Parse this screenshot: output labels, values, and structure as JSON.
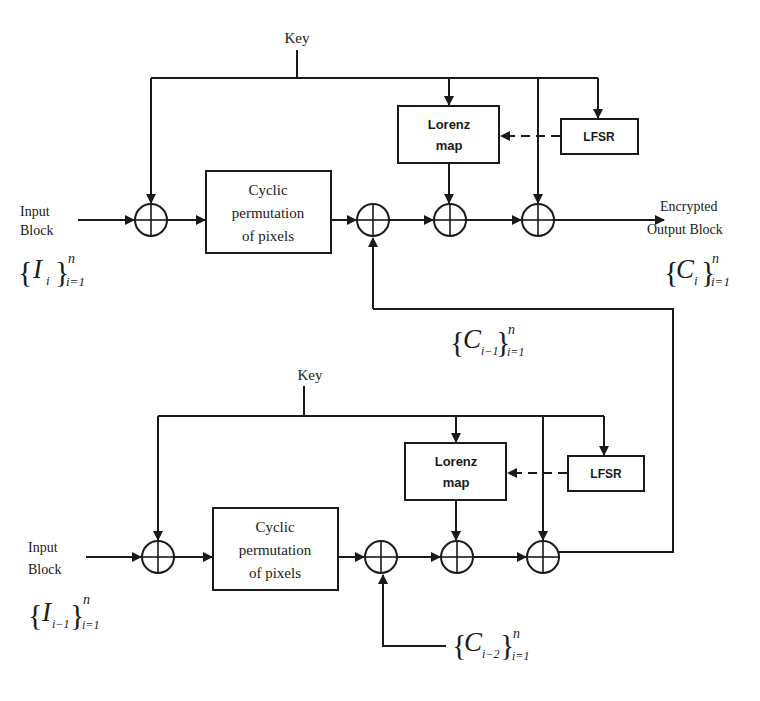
{
  "diagram": {
    "type": "block-diagram",
    "colors": {
      "stroke": "#1a1a1a",
      "background": "#ffffff"
    },
    "top_stage": {
      "key_label": "Key",
      "input_label_line1": "Input",
      "input_label_line2": "Block",
      "input_set": {
        "base": "I",
        "sub": "i",
        "sup": "n",
        "range": "i=1"
      },
      "permutation_line1": "Cyclic",
      "permutation_line2": "permutation",
      "permutation_line3": "of pixels",
      "lorenz_line1": "Lorenz",
      "lorenz_line2": "map",
      "lfsr_label": "LFSR",
      "output_label_line1": "Encrypted",
      "output_label_line2": "Output Block",
      "output_set": {
        "base": "C",
        "sub": "i",
        "sup": "n",
        "range": "i=1"
      },
      "feedback_set": {
        "base": "C",
        "sub": "i−1",
        "sup": "n",
        "range": "i=1"
      },
      "xor_icon": "circle-plus-icon"
    },
    "bottom_stage": {
      "key_label": "Key",
      "input_label_line1": "Input",
      "input_label_line2": "Block",
      "input_set": {
        "base": "I",
        "sub": "i−1",
        "sup": "n",
        "range": "i=1"
      },
      "permutation_line1": "Cyclic",
      "permutation_line2": "permutation",
      "permutation_line3": "of pixels",
      "lorenz_line1": "Lorenz",
      "lorenz_line2": "map",
      "lfsr_label": "LFSR",
      "chain_set": {
        "base": "C",
        "sub": "i−2",
        "sup": "n",
        "range": "i=1"
      },
      "xor_icon": "circle-plus-icon"
    },
    "brace_open": "{",
    "brace_close": "}"
  }
}
